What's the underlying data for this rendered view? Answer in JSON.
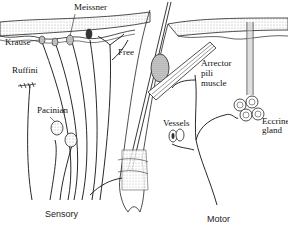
{
  "diagram": {
    "type": "anatomical-illustration",
    "labels": {
      "meissner": "Meissner",
      "krause": "Krause",
      "free": "Free",
      "ruffini": "Ruffini",
      "pacinian": "Pacinian",
      "arrector": "Arrector",
      "pili": "pili",
      "muscle": "muscle",
      "vessels": "Vessels",
      "eccrine": "Eccrine",
      "gland": "gland",
      "sensory": "Sensory",
      "motor": "Motor"
    },
    "sections": [
      {
        "name": "Sensory",
        "structures": [
          "Meissner",
          "Krause",
          "Free",
          "Ruffini",
          "Pacinian"
        ]
      },
      {
        "name": "Motor",
        "structures": [
          "Arrector pili muscle",
          "Vessels",
          "Eccrine gland"
        ]
      }
    ],
    "colors": {
      "ink": "#1a1a1a",
      "stipple": "#bdbdbd",
      "background": "#ffffff"
    }
  }
}
